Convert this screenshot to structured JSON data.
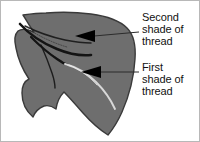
{
  "figure": {
    "colors": {
      "background": "#ffffff",
      "border": "#b8b8b8",
      "leaf_fill": "#6e6e6e",
      "leaf_outline": "#3a3a3a",
      "dark_thread": "#141414",
      "light_thread": "#d8d8d8",
      "arrow": "#000000",
      "leader_line": "#2b2b2b",
      "text": "#111111"
    }
  },
  "annotations": [
    {
      "id": "second-shade",
      "lines": [
        "Second",
        "shade of",
        "thread"
      ],
      "target": "dark thread stitching"
    },
    {
      "id": "first-shade",
      "lines": [
        "First",
        "shade of",
        "thread"
      ],
      "target": "light thread stitching"
    }
  ]
}
